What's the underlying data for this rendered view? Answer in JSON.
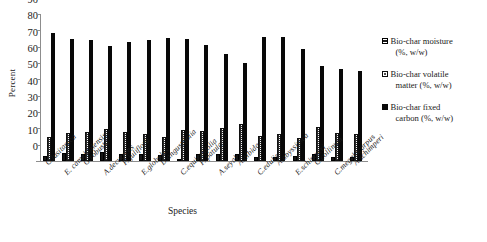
{
  "chart_data": {
    "type": "bar",
    "title": "",
    "xlabel": "Species",
    "ylabel": "Percent",
    "ylim": [
      0,
      90
    ],
    "yticks": [
      0,
      10,
      20,
      30,
      40,
      50,
      60,
      70,
      80,
      90
    ],
    "grid": false,
    "legend_position": "right",
    "categories": [
      "C.lusitanica",
      "E. camaldulensis",
      "G.robusta",
      "A.decurrens",
      "P. juliflora",
      "E.globulus",
      "D.angustifolia",
      "C.equisetifolia",
      "P. patula",
      "A.seyal",
      "A.albida",
      "C.edulis",
      "A.abyssinica",
      "E.schimperi",
      "C.collinum",
      "C.megalocarpus",
      "A.schimperi"
    ],
    "series": [
      {
        "name": "Bio-char moisture (%, w/w)",
        "color": "#161616",
        "values": [
          3.2,
          4.9,
          4.3,
          5.6,
          4.6,
          4.2,
          3.6,
          1.4,
          4.4,
          4.2,
          4.5,
          2.4,
          2.2,
          3.0,
          4.5,
          2.3,
          2.6
        ]
      },
      {
        "name": "Bio-char volatile matter (%, w/w)",
        "color": "#ffffff",
        "values": [
          15.0,
          17.2,
          17.5,
          19.6,
          18.0,
          16.6,
          15.0,
          18.7,
          18.2,
          20.5,
          22.5,
          15.5,
          16.5,
          13.9,
          20.8,
          17.0,
          16.4
        ]
      },
      {
        "name": "Bio-char fixed carbon (%, w/w)",
        "color": "#080808",
        "values": [
          78.6,
          74.4,
          73.8,
          70.5,
          72.8,
          74.1,
          75.2,
          74.7,
          71.3,
          65.8,
          60.2,
          75.9,
          76.0,
          68.8,
          58.0,
          56.2,
          55.0
        ]
      }
    ]
  },
  "axes": {
    "y_title": "Percent",
    "x_title": "Species"
  },
  "legend": {
    "items": [
      {
        "line1": "Bio-char moisture",
        "line2": "(%, w/w)",
        "swatch": "moisture"
      },
      {
        "line1": "Bio-char volatile",
        "line2": "matter (%, w/w)",
        "swatch": "volatile"
      },
      {
        "line1": "Bio-char fixed",
        "line2": "carbon (%, w/w)",
        "swatch": "fixed"
      }
    ]
  }
}
